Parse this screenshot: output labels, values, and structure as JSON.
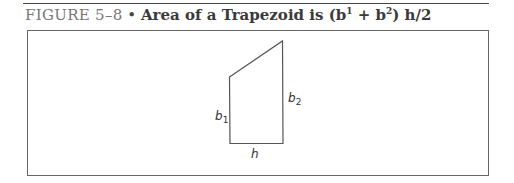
{
  "figure": {
    "label": "FIGURE 5–8",
    "separator": "•",
    "title_text": "Area of a Trapezoid is (b",
    "sup1": "1",
    "plus": " + b",
    "sup2": "2",
    "tail": ") h/2"
  },
  "diagram": {
    "shape": "trapezoid",
    "labels": {
      "b1": "b",
      "b1_sub": "1",
      "b2": "b",
      "b2_sub": "2",
      "h": "h"
    }
  }
}
